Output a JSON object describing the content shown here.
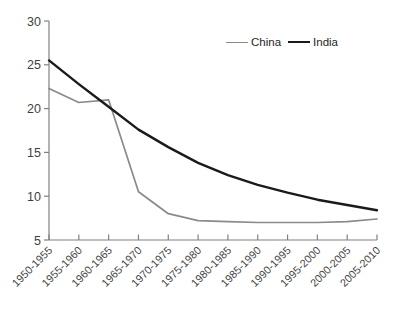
{
  "chart_data": {
    "type": "line",
    "title": "",
    "xlabel": "",
    "ylabel": "",
    "categories": [
      "1950-1955",
      "1955-1960",
      "1960-1965",
      "1965-1970",
      "1970-1975",
      "1975-1980",
      "1980-1985",
      "1985-1990",
      "1990-1995",
      "1995-2000",
      "2000-2005",
      "2005-2010"
    ],
    "series": [
      {
        "name": "China",
        "color": "#8a8a8a",
        "stroke_width": 1.7,
        "values": [
          22.3,
          20.7,
          21.0,
          10.5,
          8.0,
          7.2,
          7.1,
          7.0,
          7.0,
          7.0,
          7.1,
          7.4
        ]
      },
      {
        "name": "India",
        "color": "#1a1a1a",
        "stroke_width": 2.4,
        "values": [
          25.5,
          22.8,
          20.2,
          17.6,
          15.6,
          13.8,
          12.4,
          11.3,
          10.4,
          9.6,
          9.0,
          8.4
        ]
      }
    ],
    "ylim": [
      5,
      30
    ],
    "yticks": [
      5,
      10,
      15,
      20,
      25,
      30
    ],
    "grid": false,
    "legend_position": "top-center-inside",
    "axis_color": "#808080",
    "text_color": "#3f3f3f"
  }
}
